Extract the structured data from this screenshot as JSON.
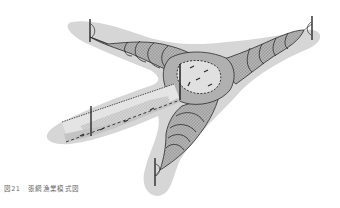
{
  "figure": {
    "label": "図21",
    "title": "張網漁業模式図",
    "colors": {
      "water_shadow": "#d4d4d4",
      "net_mid": "#b4b4b4",
      "net_dark": "#9a9a9a",
      "net_light": "#e2e2e2",
      "line": "#2a2a2a",
      "caption": "#6a6a6a"
    }
  }
}
